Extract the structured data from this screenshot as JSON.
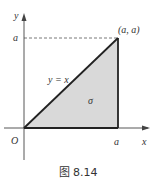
{
  "figure": {
    "caption": "图 8.14",
    "labels": {
      "y_axis": "y",
      "x_axis": "x",
      "origin": "O",
      "y_tick": "a",
      "x_tick": "a",
      "corner_point": "(a, a)",
      "line": "y = x",
      "region": "σ"
    },
    "colors": {
      "region_fill": "#d9d9d9",
      "lines": "#222222",
      "axes": "#444444"
    }
  }
}
